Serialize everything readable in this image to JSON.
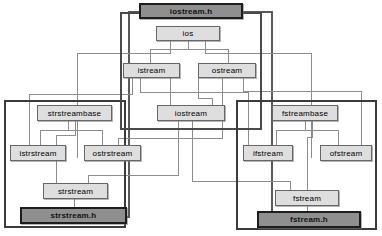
{
  "diagram": {
    "title_sliver": "C++ iostream class hierarchy",
    "type": "class-hierarchy",
    "colors": {
      "node_fill": "#dedede",
      "node_border": "#666666",
      "header_fill": "#8f8f8f",
      "header_border": "#1d1d1d",
      "frame_border": "#3b3b3b",
      "line": "#8d8d8d",
      "background": "#ffffff"
    },
    "frames": [
      {
        "name": "strstream-package",
        "x": 4,
        "y": 100,
        "w": 122,
        "h": 128
      },
      {
        "name": "iostream-package",
        "x": 120,
        "y": 12,
        "w": 142,
        "h": 118
      },
      {
        "name": "fstream-package",
        "x": 236,
        "y": 100,
        "w": 141,
        "h": 130
      }
    ],
    "nodes": [
      {
        "id": "iostream_h",
        "label": "iostream.h",
        "kind": "header",
        "x": 139,
        "y": 3,
        "w": 104,
        "h": 16
      },
      {
        "id": "ios",
        "label": "ios",
        "kind": "class",
        "x": 156,
        "y": 26,
        "w": 64,
        "h": 15
      },
      {
        "id": "istream",
        "label": "istream",
        "kind": "class",
        "x": 123,
        "y": 63,
        "w": 57,
        "h": 15
      },
      {
        "id": "ostream",
        "label": "ostream",
        "kind": "class",
        "x": 198,
        "y": 63,
        "w": 58,
        "h": 15
      },
      {
        "id": "strstreambase",
        "label": "strstreambase",
        "kind": "class",
        "x": 37,
        "y": 105,
        "w": 75,
        "h": 16
      },
      {
        "id": "iostream",
        "label": "iostream",
        "kind": "class",
        "x": 157,
        "y": 105,
        "w": 68,
        "h": 16
      },
      {
        "id": "fstreambase",
        "label": "fstreambase",
        "kind": "class",
        "x": 272,
        "y": 105,
        "w": 66,
        "h": 16
      },
      {
        "id": "istrstream",
        "label": "istrstream",
        "kind": "class",
        "x": 10,
        "y": 145,
        "w": 56,
        "h": 16
      },
      {
        "id": "ostrstream",
        "label": "ostrstream",
        "kind": "class",
        "x": 84,
        "y": 145,
        "w": 57,
        "h": 16
      },
      {
        "id": "ifstream",
        "label": "ifstream",
        "kind": "class",
        "x": 243,
        "y": 145,
        "w": 50,
        "h": 16
      },
      {
        "id": "ofstream",
        "label": "ofstream",
        "kind": "class",
        "x": 320,
        "y": 145,
        "w": 52,
        "h": 16
      },
      {
        "id": "strstream",
        "label": "strstream",
        "kind": "class",
        "x": 43,
        "y": 183,
        "w": 65,
        "h": 16
      },
      {
        "id": "fstream",
        "label": "fstream",
        "kind": "class",
        "x": 275,
        "y": 190,
        "w": 64,
        "h": 16
      },
      {
        "id": "strstream_h",
        "label": "strstream.h",
        "kind": "header",
        "x": 20,
        "y": 207,
        "w": 107,
        "h": 17
      },
      {
        "id": "fstream_h",
        "label": "fstream.h",
        "kind": "header",
        "x": 257,
        "y": 211,
        "w": 104,
        "h": 17
      }
    ],
    "edges": [
      {
        "from": "ios",
        "to": "istream"
      },
      {
        "from": "ios",
        "to": "ostream"
      },
      {
        "from": "istream",
        "to": "iostream"
      },
      {
        "from": "ostream",
        "to": "iostream"
      },
      {
        "from": "istream",
        "to": "istrstream"
      },
      {
        "from": "ostream",
        "to": "ostrstream"
      },
      {
        "from": "istream",
        "to": "ifstream"
      },
      {
        "from": "ostream",
        "to": "ofstream"
      },
      {
        "from": "strstreambase",
        "to": "istrstream"
      },
      {
        "from": "strstreambase",
        "to": "ostrstream"
      },
      {
        "from": "strstreambase",
        "to": "strstream"
      },
      {
        "from": "fstreambase",
        "to": "ifstream"
      },
      {
        "from": "fstreambase",
        "to": "ofstream"
      },
      {
        "from": "fstreambase",
        "to": "fstream"
      },
      {
        "from": "iostream",
        "to": "strstream"
      },
      {
        "from": "iostream",
        "to": "fstream"
      },
      {
        "from": "iostream_h",
        "to": "strstream-package"
      },
      {
        "from": "iostream_h",
        "to": "fstream-package"
      }
    ]
  }
}
